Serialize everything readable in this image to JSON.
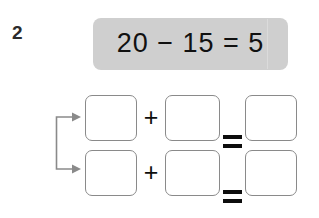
{
  "worksheet": {
    "question_number": "2",
    "equation_banner": {
      "text": "20 − 15 = 5",
      "background_color": "#cfcfcf",
      "text_color": "#111111"
    },
    "connector": {
      "icon": "bracket-arrow-right",
      "color": "#8a8a8a",
      "arrow_count": 2
    },
    "answer_rows": [
      {
        "row_label": "row-1",
        "box_1_value": "",
        "operator_1": "+",
        "box_2_value": "",
        "operator_2": "=",
        "box_3_value": ""
      },
      {
        "row_label": "row-2",
        "box_1_value": "",
        "operator_1": "+",
        "box_2_value": "",
        "operator_2": "=",
        "box_3_value": ""
      }
    ],
    "box_border_color": "#8a8a8a",
    "page_background": "#ffffff"
  }
}
